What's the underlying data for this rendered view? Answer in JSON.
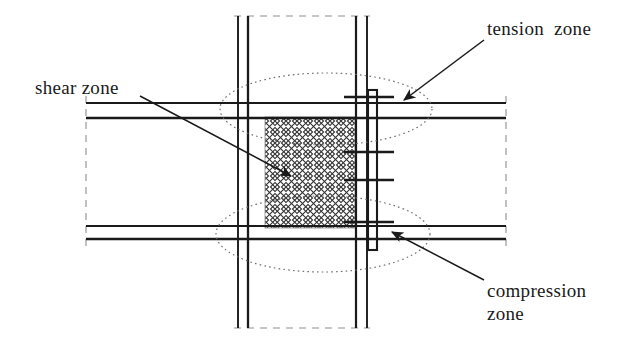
{
  "figure": {
    "type": "engineering-diagram",
    "background_color": "#ffffff",
    "line_color": "#1a1a1a",
    "hatch_color": "#2b2b2b",
    "dotted_ellipse_color": "#6d6d6d",
    "dashed_line_color": "#8a8a8a"
  },
  "labels": {
    "tension_zone": "tension  zone",
    "shear_zone": "shear zone",
    "compression_zone_line1": "compression",
    "compression_zone_line2": "zone"
  },
  "annotations": [
    {
      "name": "tension-zone",
      "text": "tension  zone",
      "leader_from": [
        484,
        40
      ],
      "arrow_to": [
        404,
        100
      ],
      "points_at": "upper-ellipse-tension-region"
    },
    {
      "name": "shear-zone",
      "text": "shear zone",
      "leader_from": [
        140,
        96
      ],
      "arrow_to": [
        291,
        176
      ],
      "points_at": "cross-hatched-panel-zone"
    },
    {
      "name": "compression-zone",
      "text": "compression zone",
      "leader_from": [
        484,
        280
      ],
      "arrow_to": [
        392,
        232
      ],
      "points_at": "lower-ellipse-compression-region"
    }
  ],
  "geometry": {
    "column": {
      "left_flange_lines_x": [
        238,
        248
      ],
      "right_flange_lines_x": [
        356,
        367
      ],
      "top_y": 16,
      "bottom_y": 328
    },
    "column_dashed_caps": {
      "top_y": 16,
      "bottom_y": 328,
      "x_from": 238,
      "x_to": 367
    },
    "upper_beam": {
      "top_flange_y": 103,
      "bottom_flange_y": 118,
      "left_x": 86,
      "right_x": 506
    },
    "lower_beam": {
      "top_flange_y": 226,
      "bottom_flange_y": 239,
      "left_x": 86,
      "right_x": 506
    },
    "beam_end_dashed_x": [
      86,
      506
    ],
    "panel_zone_hatch": {
      "x": 265,
      "y": 117,
      "width": 90,
      "height": 111,
      "pattern": "cross-hatch-diagonal"
    },
    "end_plate_right": {
      "x": 368,
      "y": 90,
      "width": 9,
      "height": 160
    },
    "bolt_rows_y": [
      97,
      152,
      180,
      222
    ],
    "bolt_line_x_from": 344,
    "bolt_line_x_to": 394,
    "ellipse_tension": {
      "cx": 326,
      "cy": 109,
      "rx": 106,
      "ry": 36
    },
    "ellipse_compression": {
      "cx": 323,
      "cy": 234,
      "rx": 107,
      "ry": 38
    }
  }
}
